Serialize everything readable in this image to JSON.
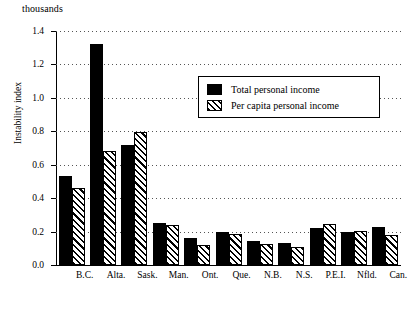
{
  "figure": {
    "units_label": "thousands",
    "y_axis_title": "Instability index"
  },
  "legend": {
    "entries": [
      {
        "label": "Total personal income",
        "pattern": "solid",
        "color": "#000000"
      },
      {
        "label": "Per capita personal income",
        "pattern": "hatch",
        "color": "#000000"
      }
    ]
  },
  "chart_data": {
    "type": "bar",
    "title": "",
    "subtitle": "",
    "xlabel": "",
    "ylabel": "Instability index",
    "units_note": "thousands",
    "categories": [
      "B.C.",
      "Alta.",
      "Sask.",
      "Man.",
      "Ont.",
      "Que.",
      "N.B.",
      "N.S.",
      "P.E.I.",
      "Nfld.",
      "Can."
    ],
    "series": [
      {
        "name": "Total personal income",
        "values": [
          0.535,
          1.325,
          0.72,
          0.25,
          0.16,
          0.195,
          0.145,
          0.13,
          0.22,
          0.2,
          0.225
        ]
      },
      {
        "name": "Per capita personal income",
        "values": [
          0.46,
          0.68,
          0.795,
          0.24,
          0.12,
          0.185,
          0.125,
          0.105,
          0.245,
          0.205,
          0.18
        ]
      }
    ],
    "ylim": [
      0.0,
      1.4
    ],
    "ytick_values": [
      0.0,
      0.2,
      0.4,
      0.6,
      0.8,
      1.0,
      1.2,
      1.4
    ],
    "ytick_labels": [
      "0.0",
      "0.2",
      "0.4",
      "0.6",
      "0.8",
      "1.0",
      "1.2",
      "1.4"
    ],
    "grid": "horizontal-dotted",
    "legend_position": "upper-center"
  }
}
